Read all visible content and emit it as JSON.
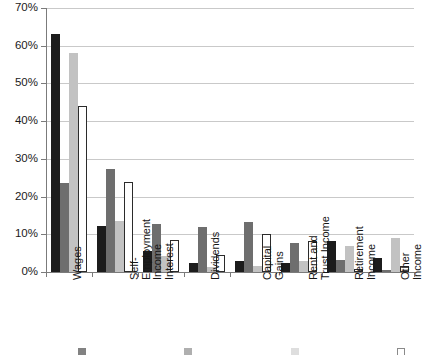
{
  "chart_data": {
    "type": "bar",
    "title": "",
    "subtitle": "",
    "xlabel": "",
    "ylabel": "",
    "ylim": [
      0,
      70
    ],
    "ytick_labels": [
      "0%",
      "10%",
      "20%",
      "30%",
      "40%",
      "50%",
      "60%",
      "70%"
    ],
    "ytick_values": [
      0,
      10,
      20,
      30,
      40,
      50,
      60,
      70
    ],
    "grid": true,
    "legend_position": "bottom",
    "categories": [
      "Wages",
      "Self-\nEmployment\nIncome",
      "Interest",
      "Dividends",
      "Capital\nGains",
      "Rent and\nTrust Income",
      "Retirement\nIncome",
      "Other\nIncome"
    ],
    "series": [
      {
        "name": "",
        "swatch": "s0",
        "color": "#1c1c1c",
        "values": [
          63.0,
          12.2,
          5.5,
          2.5,
          3.0,
          2.3,
          8.2,
          3.6
        ]
      },
      {
        "name": "",
        "swatch": "s1",
        "color": "#6e6e6e",
        "values": [
          23.5,
          27.3,
          12.8,
          12.0,
          13.2,
          7.7,
          3.2,
          0.5
        ]
      },
      {
        "name": "",
        "swatch": "s2",
        "color": "#c2c2c2",
        "values": [
          58.2,
          13.5,
          4.3,
          1.3,
          1.5,
          2.8,
          6.8,
          9.0
        ]
      },
      {
        "name": "",
        "swatch": "s3",
        "color": "#ffffff",
        "values": [
          44.0,
          23.8,
          8.5,
          4.5,
          10.0,
          8.2,
          0.8,
          1.5
        ]
      }
    ]
  }
}
